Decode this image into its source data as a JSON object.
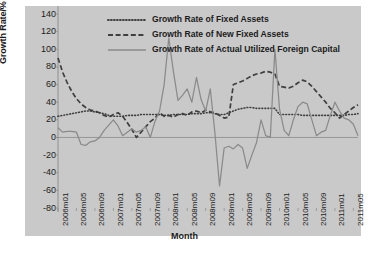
{
  "chart_data": {
    "type": "line",
    "title": "",
    "xlabel": "Month",
    "ylabel": "Growth Rate/%",
    "ylim": [
      -80,
      140
    ],
    "ytick_values": [
      140,
      120,
      100,
      80,
      60,
      40,
      20,
      0,
      -20,
      -40,
      -60,
      -80
    ],
    "ytick_labels": [
      "140",
      "120",
      "100",
      "80",
      "60",
      "40",
      "20",
      "0",
      "-20",
      "-40",
      "-60",
      "-80"
    ],
    "grid": false,
    "legend_position": "top-right-inside",
    "xtick_labels": [
      "2006m01",
      "2006m05",
      "2006m09",
      "2007m01",
      "2007m05",
      "2007m09",
      "2008m01",
      "2008m05",
      "2008m09",
      "2009m01",
      "2009m05",
      "2009m09",
      "2010m01",
      "2010m05",
      "2010m09",
      "2011m01",
      "2011m05"
    ],
    "xtick_indices": [
      0,
      4,
      8,
      12,
      16,
      20,
      24,
      28,
      32,
      36,
      40,
      44,
      48,
      52,
      56,
      60,
      64
    ],
    "x": [
      "2006m01",
      "2006m02",
      "2006m03",
      "2006m04",
      "2006m05",
      "2006m06",
      "2006m07",
      "2006m08",
      "2006m09",
      "2006m10",
      "2006m11",
      "2006m12",
      "2007m01",
      "2007m02",
      "2007m03",
      "2007m04",
      "2007m05",
      "2007m06",
      "2007m07",
      "2007m08",
      "2007m09",
      "2007m10",
      "2007m11",
      "2007m12",
      "2008m01",
      "2008m02",
      "2008m03",
      "2008m04",
      "2008m05",
      "2008m06",
      "2008m07",
      "2008m08",
      "2008m09",
      "2008m10",
      "2008m11",
      "2008m12",
      "2009m01",
      "2009m02",
      "2009m03",
      "2009m04",
      "2009m05",
      "2009m06",
      "2009m07",
      "2009m08",
      "2009m09",
      "2009m10",
      "2009m11",
      "2009m12",
      "2010m01",
      "2010m02",
      "2010m03",
      "2010m04",
      "2010m05",
      "2010m06",
      "2010m07",
      "2010m08",
      "2010m09",
      "2010m10",
      "2010m11",
      "2010m12",
      "2011m01",
      "2011m02",
      "2011m03",
      "2011m04",
      "2011m05",
      "2011m06"
    ],
    "series": [
      {
        "name": "Growth Rate of Fixed Assets",
        "style": "dotted",
        "color": "#3f3f3f",
        "values": [
          24,
          25,
          26,
          27,
          28,
          29,
          30,
          30,
          29,
          28,
          27,
          25,
          24,
          24,
          24,
          25,
          25,
          25,
          26,
          26,
          26,
          26,
          26,
          25,
          25,
          26,
          26,
          26,
          26,
          27,
          27,
          27,
          28,
          28,
          27,
          26,
          26,
          28,
          30,
          32,
          33,
          34,
          34,
          33,
          33,
          33,
          33,
          33,
          26,
          26,
          26,
          26,
          26,
          25,
          25,
          25,
          25,
          25,
          25,
          25,
          25,
          25,
          25,
          26,
          26,
          27
        ]
      },
      {
        "name": "Growth Rate of New Fixed Assets",
        "style": "dashed",
        "color": "#3f3f3f",
        "values": [
          90,
          74,
          62,
          52,
          44,
          38,
          34,
          31,
          30,
          28,
          25,
          23,
          26,
          28,
          24,
          17,
          9,
          0,
          6,
          12,
          18,
          22,
          28,
          24,
          25,
          23,
          26,
          27,
          25,
          29,
          30,
          28,
          31,
          29,
          28,
          25,
          22,
          23,
          60,
          62,
          64,
          67,
          70,
          72,
          73,
          75,
          74,
          72,
          58,
          57,
          56,
          58,
          62,
          65,
          63,
          58,
          52,
          46,
          40,
          33,
          28,
          22,
          26,
          30,
          34,
          37
        ]
      },
      {
        "name": "Growth Rate of Actual Utilized Foreign Capital",
        "style": "solid",
        "color": "#8a8a8a",
        "values": [
          11,
          6,
          7,
          7,
          6,
          -8,
          -9,
          -5,
          -4,
          0,
          8,
          14,
          20,
          13,
          2,
          6,
          10,
          6,
          8,
          12,
          0,
          18,
          30,
          60,
          113,
          75,
          42,
          48,
          55,
          40,
          68,
          43,
          30,
          55,
          5,
          -55,
          -12,
          -10,
          -13,
          -8,
          -12,
          -35,
          -20,
          -6,
          20,
          2,
          0,
          100,
          32,
          8,
          2,
          20,
          35,
          40,
          38,
          20,
          2,
          6,
          8,
          25,
          40,
          30,
          22,
          20,
          15,
          2
        ]
      }
    ]
  },
  "legend": {
    "items": [
      {
        "label": "Growth Rate of Fixed Assets",
        "style": "dotted"
      },
      {
        "label": "Growth Rate of New Fixed Assets",
        "style": "dashed"
      },
      {
        "label": "Growth Rate of Actual Utilized Foreign Capital",
        "style": "solid"
      }
    ]
  },
  "colors": {
    "plot_background": "#c9c9c9",
    "page_background": "#ffffff",
    "axis": "#8a8a8a",
    "text": "#1b1b1b"
  }
}
